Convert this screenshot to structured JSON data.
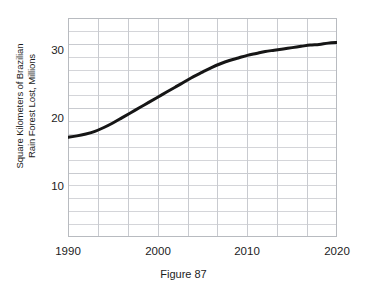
{
  "figure": {
    "caption": "Figure 87"
  },
  "axes": {
    "ylabel_line1": "Square Kilometers of Brazilian",
    "ylabel_line2": "Rain Forest Lost, Millions",
    "xlabel": "",
    "ytick_labels": [
      "30",
      "20",
      "10"
    ],
    "xtick_labels": [
      "1990",
      "2000",
      "2010",
      "2020"
    ]
  },
  "chart_data": {
    "type": "line",
    "title": "",
    "subtitle": "",
    "caption": "Figure 87",
    "xlabel": "",
    "ylabel": "Square Kilometers of Brazilian Rain Forest Lost, Millions",
    "xlim": [
      1990,
      2020
    ],
    "ylim": [
      0,
      34
    ],
    "xticks": [
      1990,
      2000,
      2010,
      2020
    ],
    "yticks": [
      10,
      20,
      30
    ],
    "y_minor_tick_step": 2,
    "x_minor_tick_step": 3.3333,
    "grid": true,
    "grid_color": "#c9cbd0",
    "legend": null,
    "legend_position": "none",
    "series": [
      {
        "name": "Brazilian rain forest lost",
        "color": "#161616",
        "line_width": 3.0,
        "x": [
          1990,
          1991,
          1992,
          1993,
          1994,
          1995,
          1996,
          1997,
          1998,
          1999,
          2000,
          2001,
          2002,
          2003,
          2004,
          2005,
          2006,
          2007,
          2008,
          2009,
          2010,
          2011,
          2012,
          2013,
          2014,
          2015,
          2016,
          2017,
          2018,
          2019,
          2020
        ],
        "values": [
          15.5,
          15.7,
          16.0,
          16.4,
          17.0,
          17.7,
          18.5,
          19.3,
          20.1,
          20.9,
          21.7,
          22.5,
          23.3,
          24.1,
          24.9,
          25.6,
          26.3,
          26.9,
          27.4,
          27.8,
          28.2,
          28.5,
          28.8,
          29.0,
          29.2,
          29.4,
          29.6,
          29.8,
          29.9,
          30.1,
          30.2
        ]
      }
    ]
  },
  "colors": {
    "line": "#161616",
    "grid": "#c9cbd0",
    "frame": "#b8bbc0",
    "text": "#1c1c1c",
    "background": "#ffffff"
  }
}
